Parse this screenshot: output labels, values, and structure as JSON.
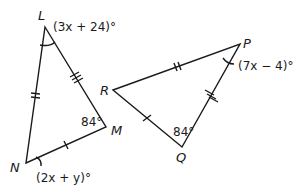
{
  "diagram": {
    "type": "congruent-triangles",
    "triangles": [
      {
        "name": "LMN",
        "vertices": {
          "L": {
            "label": "L",
            "x": 45,
            "y": 27
          },
          "M": {
            "label": "M",
            "x": 106,
            "y": 127
          },
          "N": {
            "label": "N",
            "x": 26,
            "y": 163
          }
        },
        "angles": {
          "L": "(3x + 24)°",
          "M": "84°",
          "N": "(2x + y)°"
        },
        "tick_marks": {
          "LN": 2,
          "LM": 3,
          "MN": 1
        }
      },
      {
        "name": "PQR",
        "vertices": {
          "R": {
            "label": "R",
            "x": 113,
            "y": 90
          },
          "P": {
            "label": "P",
            "x": 240,
            "y": 44
          },
          "Q": {
            "label": "Q",
            "x": 182,
            "y": 147
          }
        },
        "angles": {
          "P": "(7x − 4)°",
          "Q": "84°"
        },
        "tick_marks": {
          "RP": 2,
          "PQ": 3,
          "RQ": 1
        }
      }
    ],
    "labels": {
      "L": "L",
      "M": "M",
      "N": "N",
      "R": "R",
      "P": "P",
      "Q": "Q",
      "angle_L": "(3x + 24)°",
      "angle_M": "84°",
      "angle_N": "(2x + y)°",
      "angle_P": "(7x − 4)°",
      "angle_Q": "84°"
    },
    "colors": {
      "stroke": "#1a1a1a",
      "background": "#ffffff"
    }
  }
}
